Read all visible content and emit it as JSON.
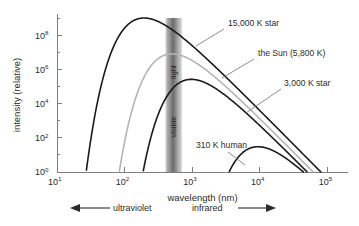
{
  "chart_data": {
    "type": "line",
    "title": "",
    "xlabel": "wavelength (nm)",
    "ylabel": "intensity (relative)",
    "xscale": "log",
    "yscale": "log",
    "xlim": [
      10,
      200000
    ],
    "ylim": [
      1,
      1000000000
    ],
    "grid": false,
    "legend": "annotations on curves",
    "x_ticks": [
      {
        "value": 10,
        "base": "10",
        "exp": "1"
      },
      {
        "value": 100,
        "base": "10",
        "exp": "2"
      },
      {
        "value": 1000,
        "base": "10",
        "exp": "3"
      },
      {
        "value": 10000,
        "base": "10",
        "exp": "4"
      },
      {
        "value": 100000,
        "base": "10",
        "exp": "5"
      }
    ],
    "y_ticks": [
      {
        "value": 1,
        "base": "10",
        "exp": "0"
      },
      {
        "value": 100,
        "base": "10",
        "exp": "2"
      },
      {
        "value": 10000,
        "base": "10",
        "exp": "4"
      },
      {
        "value": 1000000,
        "base": "10",
        "exp": "6"
      },
      {
        "value": 100000000,
        "base": "10",
        "exp": "8"
      }
    ],
    "series": [
      {
        "name": "15,000 K star",
        "temperature_K": 15000,
        "color": "#1a1a1a",
        "width": 1.6,
        "scale": 1.0,
        "peak_wavelength_nm": 193,
        "peak_intensity": 1000000000,
        "label": "15,000 K star",
        "label_x": 228,
        "label_y": 26,
        "leader": [
          [
            224,
            29
          ],
          [
            196,
            46
          ]
        ]
      },
      {
        "name": "the Sun (5,800 K)",
        "temperature_K": 5800,
        "color": "#b4b4b4",
        "width": 1.6,
        "scale": 1.0,
        "peak_wavelength_nm": 500,
        "peak_intensity": 8000000,
        "label": "the Sun (5,800 K)",
        "label_x": 258,
        "label_y": 56,
        "leader": [
          [
            254,
            59
          ],
          [
            222,
            78
          ]
        ]
      },
      {
        "name": "3,000 K star",
        "temperature_K": 3000,
        "color": "#1a1a1a",
        "width": 1.6,
        "scale": 1.0,
        "peak_wavelength_nm": 966,
        "peak_intensity": 260000,
        "label": "3,000 K star",
        "label_x": 284,
        "label_y": 86,
        "leader": [
          [
            281,
            89
          ],
          [
            246,
            113
          ]
        ]
      },
      {
        "name": "310 K human",
        "temperature_K": 310,
        "color": "#1a1a1a",
        "width": 1.6,
        "scale": 1.0,
        "peak_wavelength_nm": 9350,
        "peak_intensity": 30,
        "label": "310 K human",
        "label_x": 196,
        "label_y": 148,
        "leader": [
          [
            228,
            152
          ],
          [
            245,
            165
          ]
        ]
      }
    ],
    "visible_band": {
      "label_top": "light",
      "label_bottom": "visible",
      "range_nm": [
        400,
        700
      ],
      "colors": [
        "#d9d9d9",
        "#9a9a9a",
        "#6f6f6f",
        "#9a9a9a",
        "#cfcfcf"
      ]
    },
    "spectrum_markers": [
      {
        "name": "ultraviolet",
        "label": "ultraviolet",
        "direction": "left"
      },
      {
        "name": "infrared",
        "label": "infrared",
        "direction": "right"
      }
    ]
  }
}
